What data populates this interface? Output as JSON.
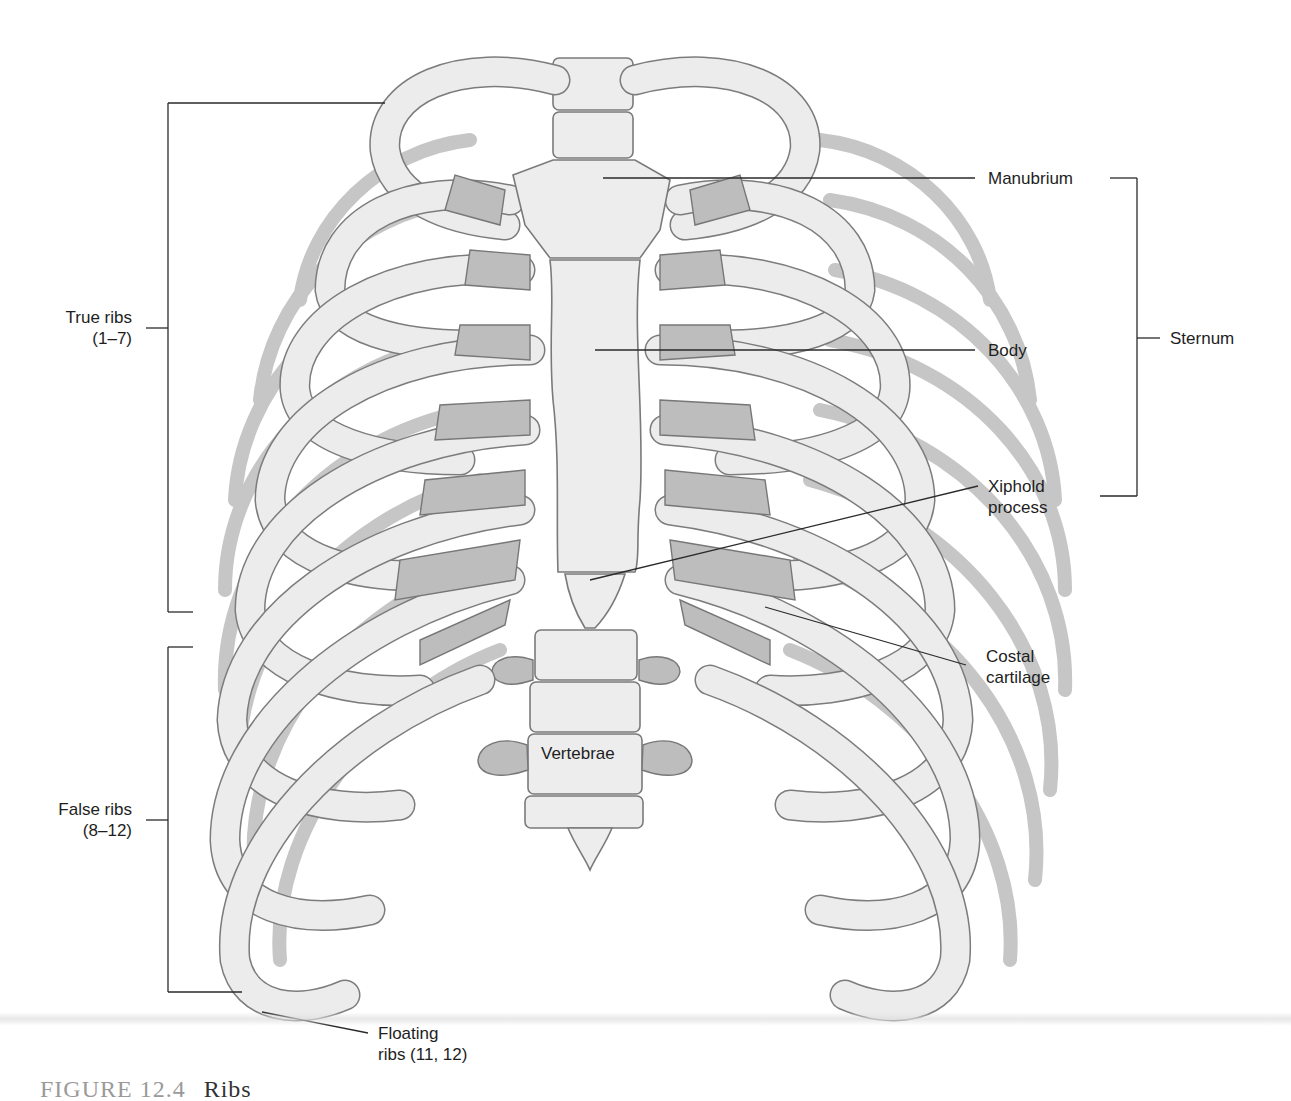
{
  "figure": {
    "caption_number": "FIGURE 12.4",
    "caption_title": "Ribs"
  },
  "labels": {
    "manubrium": "Manubrium",
    "body": "Body",
    "sternum": "Sternum",
    "xiphoid_line1": "Xiphold",
    "xiphoid_line2": "process",
    "costal_line1": "Costal",
    "costal_line2": "cartilage",
    "true_ribs_line1": "True ribs",
    "true_ribs_line2": "(1–7)",
    "false_ribs_line1": "False ribs",
    "false_ribs_line2": "(8–12)",
    "floating_line1": "Floating",
    "floating_line2": "ribs (11, 12)",
    "vertebrae": "Vertebrae"
  },
  "colors": {
    "bone": "#ededed",
    "bone_outline": "#7a7a7a",
    "cartilage": "#bdbdbd",
    "back_rib": "#c9c9c9",
    "leader_line": "#2a2a2a"
  }
}
